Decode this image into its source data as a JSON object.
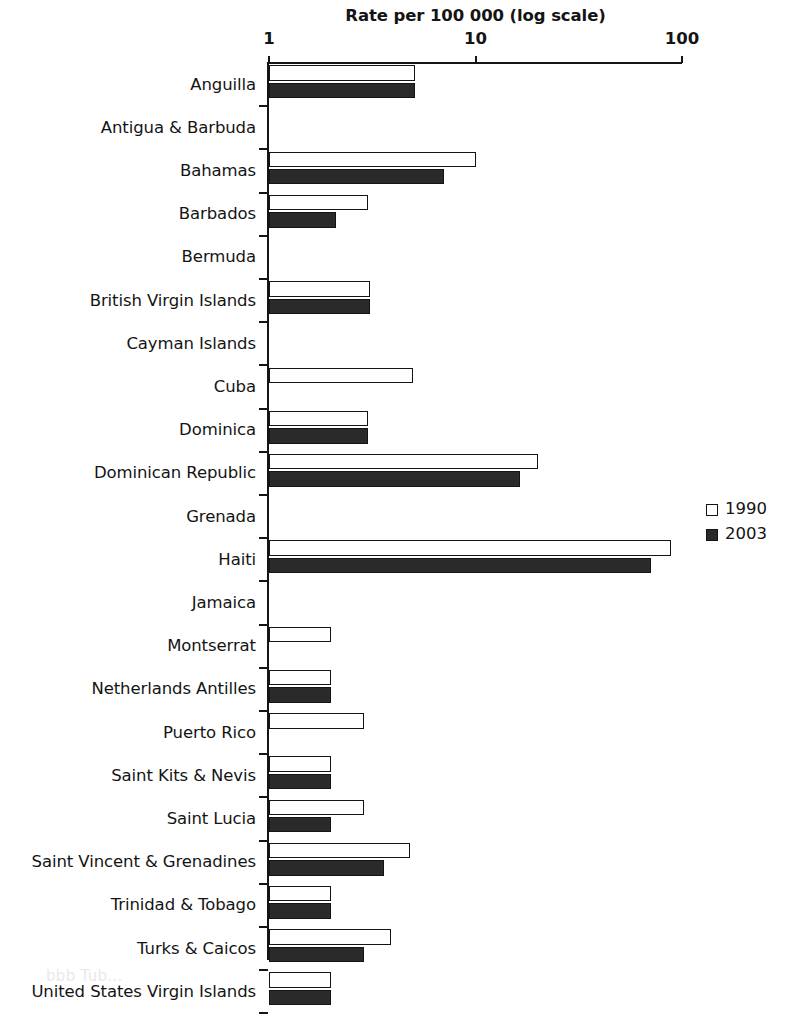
{
  "chart_data": {
    "type": "bar",
    "orientation": "horizontal",
    "title": "Rate per 100 000 (log scale)",
    "xlabel": "Rate per 100 000 (log scale)",
    "ylabel": "",
    "scale": "log",
    "xlim": [
      1,
      100
    ],
    "xticks": [
      1,
      10,
      100
    ],
    "xtick_labels": [
      "1",
      "10",
      "100"
    ],
    "grid": false,
    "legend_position": "right",
    "categories": [
      "Anguilla",
      "Antigua & Barbuda",
      "Bahamas",
      "Barbados",
      "Bermuda",
      "British Virgin Islands",
      "Cayman Islands",
      "Cuba",
      "Dominica",
      "Dominican Republic",
      "Grenada",
      "Haiti",
      "Jamaica",
      "Montserrat",
      "Netherlands Antilles",
      "Puerto Rico",
      "Saint Kits & Nevis",
      "Saint Lucia",
      "Saint Vincent & Grenadines",
      "Trinidad & Tobago",
      "Turks & Caicos",
      "United States Virgin Islands"
    ],
    "series": [
      {
        "name": "1990",
        "color": "#ffffff",
        "values": [
          5.1,
          0,
          10.0,
          3.0,
          0,
          3.1,
          0,
          5.0,
          3.0,
          20.0,
          0,
          88.0,
          0,
          2.0,
          2.0,
          2.9,
          2.0,
          2.9,
          4.8,
          2.0,
          3.9,
          2.0
        ]
      },
      {
        "name": "2003",
        "color": "#2a2a2a",
        "values": [
          5.1,
          0,
          7.0,
          2.1,
          0,
          3.1,
          0,
          0,
          3.0,
          16.5,
          0,
          71.0,
          0,
          0,
          2.0,
          0,
          2.0,
          2.0,
          3.6,
          2.0,
          2.9,
          2.0
        ]
      }
    ]
  },
  "legend": {
    "items": [
      {
        "label": "1990",
        "swatch": "white-square"
      },
      {
        "label": "2003",
        "swatch": "black-square"
      }
    ]
  },
  "colors": {
    "axis": "#151515",
    "bar_1990_fill": "#ffffff",
    "bar_2003_fill": "#2a2a2a",
    "bar_outline": "#141414",
    "text": "#141414",
    "background": "#ffffff"
  },
  "caption_fragment": "bbb  Tub..."
}
